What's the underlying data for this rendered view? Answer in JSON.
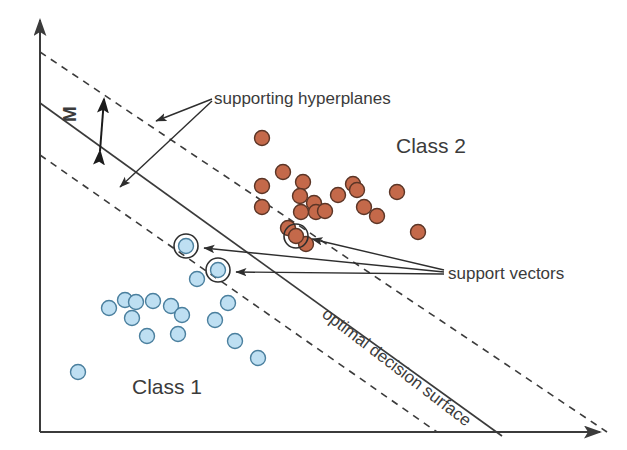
{
  "figure": {
    "background_color": "#ffffff",
    "width": 627,
    "height": 450
  },
  "labels": {
    "class2": "Class 2",
    "class1": "Class 1",
    "supporting_hyperplanes": "supporting hyperplanes",
    "support_vectors": "support vectors",
    "optimal_decision_surface": "optimal decision surface",
    "margin": "M"
  },
  "colors": {
    "class1_fill": "#bedff2",
    "class1_stroke": "#4a7f9e",
    "class2_fill": "#c4694a",
    "class2_stroke": "#5b3526",
    "line": "#3b3b3b",
    "axis": "#3b3b3b",
    "text": "#3b3b3b"
  },
  "chart_data": {
    "type": "scatter",
    "xlabel": "",
    "ylabel": "",
    "grid": false,
    "legend_position": "in-plot annotations",
    "axes": {
      "x_axis": {
        "x1": 40,
        "y1": 432,
        "x2": 607,
        "y2": 432,
        "arrow": "right"
      },
      "y_axis": {
        "x1": 40,
        "y1": 432,
        "x2": 40,
        "y2": 14,
        "arrow": "up"
      }
    },
    "lines": [
      {
        "name": "optimal decision surface",
        "style": "solid",
        "x1": 40,
        "y1": 103,
        "x2": 500,
        "y2": 436
      },
      {
        "name": "supporting hyperplane upper",
        "style": "dashed",
        "x1": 40,
        "y1": 52,
        "x2": 607,
        "y2": 432
      },
      {
        "name": "supporting hyperplane lower",
        "style": "dashed",
        "x1": 40,
        "y1": 155,
        "x2": 437,
        "y2": 432
      }
    ],
    "margin_arrow": {
      "name": "M",
      "label": "M",
      "x1": 100,
      "y1": 151,
      "x2": 104,
      "y2": 99,
      "double_headed": true
    },
    "series": [
      {
        "name": "Class 1",
        "marker": "circle",
        "fill": "#bedff2",
        "stroke": "#4a7f9e",
        "points": [
          [
            78,
            372
          ],
          [
            109,
            308
          ],
          [
            125,
            300
          ],
          [
            136,
            302
          ],
          [
            153,
            301
          ],
          [
            132,
            318
          ],
          [
            171,
            306
          ],
          [
            182,
            315
          ],
          [
            147,
            336
          ],
          [
            178,
            334
          ],
          [
            228,
            303
          ],
          [
            215,
            320
          ],
          [
            235,
            341
          ],
          [
            258,
            358
          ],
          [
            197,
            279
          ]
        ]
      },
      {
        "name": "Class 2",
        "marker": "circle",
        "fill": "#c4694a",
        "stroke": "#5b3526",
        "points": [
          [
            262,
            138
          ],
          [
            283,
            172
          ],
          [
            262,
            186
          ],
          [
            303,
            182
          ],
          [
            300,
            196
          ],
          [
            262,
            207
          ],
          [
            314,
            203
          ],
          [
            316,
            212
          ],
          [
            325,
            211
          ],
          [
            301,
            212
          ],
          [
            338,
            195
          ],
          [
            353,
            184
          ],
          [
            357,
            190
          ],
          [
            397,
            192
          ],
          [
            364,
            207
          ],
          [
            377,
            216
          ],
          [
            418,
            232
          ],
          [
            306,
            244
          ],
          [
            288,
            228
          ]
        ]
      }
    ],
    "support_vectors": [
      {
        "class": "Class 1",
        "x": 186,
        "y": 246
      },
      {
        "class": "Class 1",
        "x": 218,
        "y": 270
      },
      {
        "class": "Class 2",
        "x": 296,
        "y": 236
      }
    ],
    "annotation_arrows": [
      {
        "from_label": "supporting hyperplanes",
        "to_x": 152,
        "to_y": 120
      },
      {
        "from_label": "supporting hyperplanes",
        "to_x": 116,
        "to_y": 188
      },
      {
        "from_label": "support vectors",
        "to_x": 200,
        "to_y": 248
      },
      {
        "from_label": "support vectors",
        "to_x": 232,
        "to_y": 271
      },
      {
        "from_label": "support vectors",
        "to_x": 308,
        "to_y": 238
      }
    ]
  }
}
